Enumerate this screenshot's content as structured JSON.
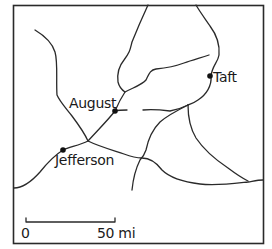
{
  "map": {
    "cities": [
      {
        "name": "August",
        "x": 115,
        "y": 111
      },
      {
        "name": "Taft",
        "x": 210,
        "y": 76
      },
      {
        "name": "Jefferson",
        "x": 63,
        "y": 150
      }
    ],
    "scale_bar": {
      "start_label": "0",
      "end_label": "50 mi"
    },
    "colors": {
      "line": "#2a2a2a",
      "border": "#2a2a2a",
      "background": "#ffffff"
    }
  }
}
